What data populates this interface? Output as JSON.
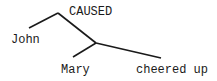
{
  "diagram": {
    "type": "parse-tree",
    "nodes": {
      "root": {
        "label": "CAUSED"
      },
      "agent": {
        "label": "John"
      },
      "patient": {
        "label": "Mary"
      },
      "event": {
        "label": "cheered up"
      }
    },
    "edges": [
      {
        "from": "root",
        "to": "agent"
      },
      {
        "from": "root",
        "to": "junction"
      },
      {
        "from": "junction",
        "to": "patient"
      },
      {
        "from": "junction",
        "to": "event"
      }
    ],
    "line_color": "#1a1a1a"
  }
}
